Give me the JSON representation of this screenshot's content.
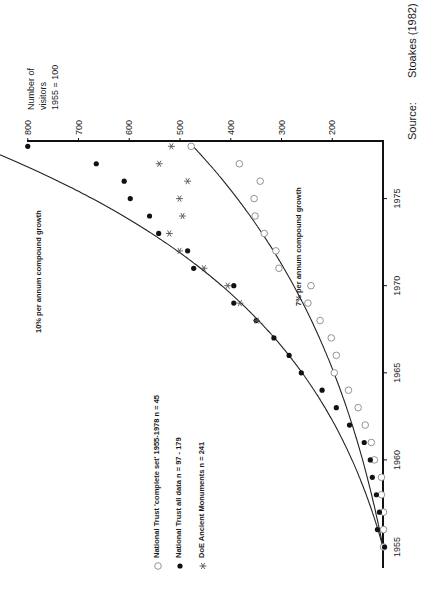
{
  "figure": {
    "source_label": "Source:",
    "source_value": "Stoakes (1982)",
    "yaxis_title_line1": "Number of",
    "yaxis_title_line2": "visitors",
    "yaxis_title_line3": "1955 = 100",
    "curve_label_10": "10% per annum compound growth",
    "curve_label_7": "7% per annum compound growth",
    "legend": [
      {
        "marker": "open-circle",
        "label": "National Trust 'complete set' 1955-1978  n = 45"
      },
      {
        "marker": "filled-circle",
        "label": "National Trust all data  n = 97 - 179"
      },
      {
        "marker": "asterisk",
        "label": "DoE Ancient Monuments  n = 241"
      }
    ]
  },
  "chart_data": {
    "type": "scatter",
    "orientation": "rotated 90 degrees counter-clockwise (value axis along top, year axis along right edge)",
    "title": "",
    "xlabel": "Year",
    "ylabel": "Number of visitors 1955 = 100",
    "x_ticks": [
      1955,
      1960,
      1965,
      1970,
      1975
    ],
    "y_ticks": [
      200,
      300,
      400,
      500,
      600,
      700,
      800
    ],
    "xlim": [
      1954.5,
      1978.3
    ],
    "ylim": [
      100,
      800
    ],
    "grid": false,
    "legend_position": "lower left (rotated)",
    "series": [
      {
        "name": "National Trust 'complete set' 1955-1978  n = 45",
        "marker": "open-circle",
        "x": [
          1955,
          1956,
          1957,
          1958,
          1959,
          1960,
          1961,
          1962,
          1963,
          1964,
          1965,
          1966,
          1967,
          1968,
          1969,
          1970,
          1971,
          1972,
          1973,
          1974,
          1975,
          1976,
          1977,
          1978
        ],
        "y": [
          99,
          99,
          99,
          103,
          103,
          117,
          123,
          135,
          149,
          168,
          196,
          192,
          202,
          224,
          248,
          242,
          305,
          311,
          334,
          352,
          354,
          342,
          383,
          478
        ]
      },
      {
        "name": "National Trust all data  n = 97 - 179",
        "marker": "filled-circle",
        "x": [
          1955,
          1956,
          1957,
          1958,
          1959,
          1960,
          1961,
          1962,
          1963,
          1964,
          1965,
          1966,
          1967,
          1968,
          1969,
          1970,
          1971,
          1972,
          1973,
          1974,
          1975,
          1976,
          1977,
          1978
        ],
        "y": [
          97,
          111,
          107,
          113,
          121,
          125,
          137,
          166,
          192,
          220,
          261,
          285,
          315,
          350,
          394,
          394,
          473,
          485,
          542,
          560,
          598,
          610,
          665,
          800
        ]
      },
      {
        "name": "DoE Ancient Monuments  n = 241",
        "marker": "asterisk",
        "x": [
          1968,
          1969,
          1970,
          1971,
          1972,
          1973,
          1974,
          1975,
          1976,
          1977,
          1978
        ],
        "y": [
          349,
          382,
          406,
          453,
          501,
          521,
          495,
          501,
          485,
          541,
          517
        ]
      },
      {
        "name": "10% per annum compound growth",
        "type": "line",
        "x": [
          1955,
          1960,
          1965,
          1970,
          1975,
          1978.3
        ],
        "y": [
          100,
          161,
          259,
          418,
          673,
          870
        ]
      },
      {
        "name": "7% per annum compound growth",
        "type": "line",
        "x": [
          1955,
          1960,
          1965,
          1970,
          1975,
          1978
        ],
        "y": [
          100,
          140,
          197,
          276,
          387,
          474
        ]
      }
    ]
  }
}
